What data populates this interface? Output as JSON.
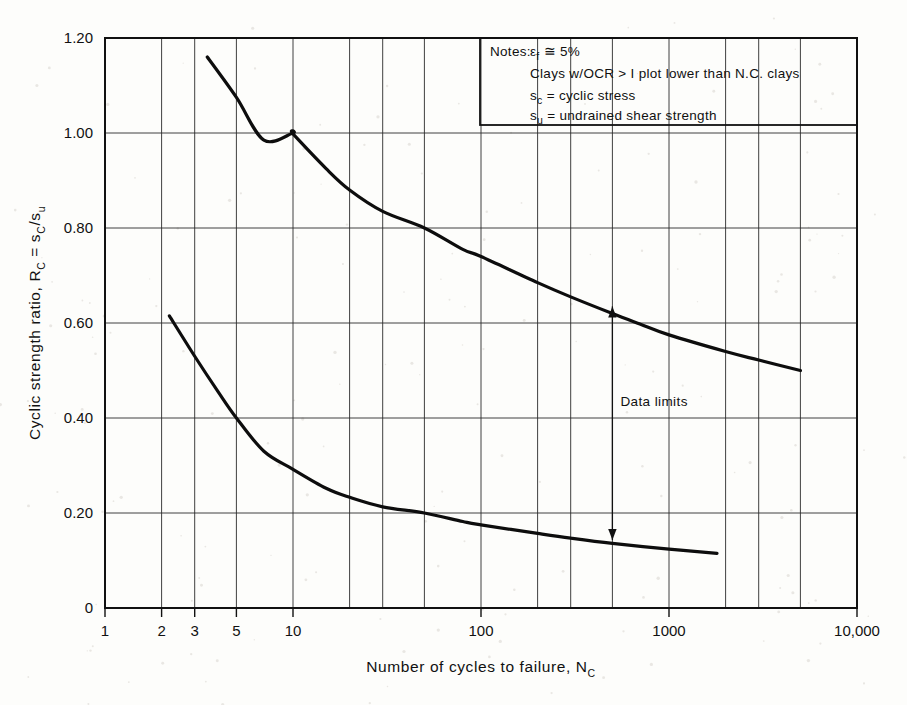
{
  "chart_data": {
    "type": "line",
    "title": "",
    "xlabel": "Number of cycles to failure, N_C",
    "ylabel": "Cyclic strength ratio, R_C = s_C/s_u",
    "xscale": "log",
    "yscale": "linear",
    "xlim": [
      1,
      10000
    ],
    "ylim": [
      0,
      1.2
    ],
    "grid": true,
    "legend": "none",
    "x_tick_labels": [
      "1",
      "2",
      "3",
      "5",
      "10",
      "100",
      "1000",
      "10,000"
    ],
    "x_tick_values": [
      1,
      2,
      3,
      5,
      10,
      100,
      1000,
      10000
    ],
    "x_gridline_values": [
      1,
      2,
      3,
      5,
      10,
      20,
      30,
      50,
      100,
      200,
      300,
      500,
      1000,
      2000,
      3000,
      5000,
      10000
    ],
    "y_tick_labels": [
      "0",
      "0.20",
      "0.40",
      "0.60",
      "0.80",
      "1.00",
      "1.20"
    ],
    "y_tick_values": [
      0,
      0.2,
      0.4,
      0.6,
      0.8,
      1.0,
      1.2
    ],
    "series": [
      {
        "name": "Upper data limit",
        "points": [
          [
            3.5,
            1.16
          ],
          [
            5,
            1.075
          ],
          [
            7,
            0.985
          ],
          [
            10,
            1.0
          ],
          [
            10,
            0.998
          ],
          [
            15,
            0.925
          ],
          [
            20,
            0.88
          ],
          [
            30,
            0.835
          ],
          [
            50,
            0.8
          ],
          [
            80,
            0.755
          ],
          [
            100,
            0.74
          ],
          [
            200,
            0.685
          ],
          [
            300,
            0.655
          ],
          [
            500,
            0.62
          ],
          [
            700,
            0.598
          ],
          [
            1000,
            0.575
          ],
          [
            2000,
            0.54
          ],
          [
            3000,
            0.522
          ],
          [
            5000,
            0.5
          ]
        ]
      },
      {
        "name": "Lower data limit",
        "points": [
          [
            2.2,
            0.615
          ],
          [
            3,
            0.53
          ],
          [
            4,
            0.455
          ],
          [
            5,
            0.4
          ],
          [
            7,
            0.33
          ],
          [
            10,
            0.292
          ],
          [
            15,
            0.252
          ],
          [
            20,
            0.233
          ],
          [
            30,
            0.213
          ],
          [
            50,
            0.2
          ],
          [
            80,
            0.182
          ],
          [
            100,
            0.175
          ],
          [
            200,
            0.157
          ],
          [
            300,
            0.147
          ],
          [
            500,
            0.136
          ],
          [
            1000,
            0.124
          ],
          [
            1800,
            0.115
          ]
        ]
      }
    ],
    "annotations": [
      {
        "name": "data-limits",
        "text": "Data limits",
        "x": 500,
        "y_top": 0.635,
        "y_bottom": 0.143,
        "arrow": "double"
      }
    ]
  },
  "notes": {
    "label": "Notes:",
    "lines": [
      {
        "id": "strain",
        "prefix": "ε",
        "subscript": "f",
        "body": " ≅  5%"
      },
      {
        "id": "ocr",
        "text": "Clays  w/OCR  >  I  plot  lower  than  N.C.  clays"
      },
      {
        "id": "sc",
        "prefix": "s",
        "subscript": "c",
        "body": "  =   cyclic  stress"
      },
      {
        "id": "su",
        "prefix": "s",
        "subscript": "u",
        "body": "  =  undrained  shear   strength"
      }
    ]
  },
  "axes": {
    "x_title_main": "Number  of  cycles  to  failure,  N",
    "x_title_sub": "C",
    "y_title_part1": "Cyclic  strength  ratio,  R",
    "y_title_sub1": "C",
    "y_title_part2": " = s",
    "y_title_sub2": "C",
    "y_title_part3": "/s",
    "y_title_sub3": "u"
  },
  "colors": {
    "curve": "#0d0d0d",
    "grid": "#2a2a2a",
    "frame": "#111111",
    "background": "#fdfdfb"
  }
}
